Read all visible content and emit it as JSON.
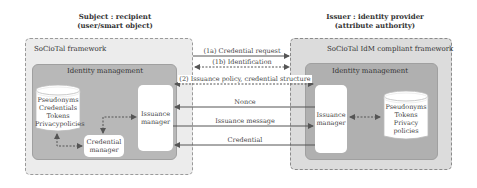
{
  "subject": {
    "title_line1": "Subject : recipient",
    "title_line2": "(user/smart object)",
    "framework_label": "SoCioTal framework",
    "idm_label": "Identity management",
    "store_items": [
      "Pseudonyms",
      "Credentials",
      "Tokens",
      "Privacypolicies"
    ],
    "credential_manager": [
      "Credential",
      "manager"
    ],
    "issuance_manager": [
      "Issuance",
      "manager"
    ]
  },
  "issuer": {
    "title_line1": "Issuer : identity provider",
    "title_line2": "(attribute authority)",
    "framework_label": "SoCioTal IdM compliant framework",
    "idm_label": "Identity management",
    "issuance_manager": [
      "Issuance",
      "manager"
    ],
    "store_items": [
      "Pseudonyms",
      "Tokens",
      "Privacy",
      "policies"
    ]
  },
  "messages": [
    {
      "id": "1a",
      "label": "(1a) Credential request",
      "direction": "subject-to-issuer",
      "style": "solid"
    },
    {
      "id": "1b",
      "label": "(1b) Identification",
      "direction": "bidirectional",
      "style": "dashed"
    },
    {
      "id": "2",
      "label": "(2) Issuance policy, credential structure",
      "direction": "bidirectional",
      "style": "dashed"
    },
    {
      "id": "nonce",
      "label": "Nonce",
      "direction": "issuer-to-subject",
      "style": "solid"
    },
    {
      "id": "issuance",
      "label": "Issuance message",
      "direction": "subject-to-issuer",
      "style": "solid"
    },
    {
      "id": "credential",
      "label": "Credential",
      "direction": "issuer-to-subject",
      "style": "solid"
    }
  ],
  "colors": {
    "outer_fill": "#ececec",
    "inner_fill": "#b8b8b8",
    "arrow": "#555555",
    "box": "#ffffff"
  }
}
